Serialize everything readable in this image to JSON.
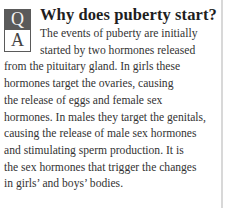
{
  "badge": {
    "q": "Q",
    "a": "A"
  },
  "title": "Why does puberty start?",
  "body_lines": [
    "The events of puberty are initially",
    "started by two hormones released",
    "from the pituitary gland. In girls these",
    "hormones target the ovaries, causing",
    "the release of eggs and female sex",
    "hormones. In males they target the genitals,",
    "causing the release of male sex hormones",
    "and stimulating sperm production. It is",
    "the sex hormones that trigger the changes",
    "in girls’ and boys’ bodies."
  ]
}
